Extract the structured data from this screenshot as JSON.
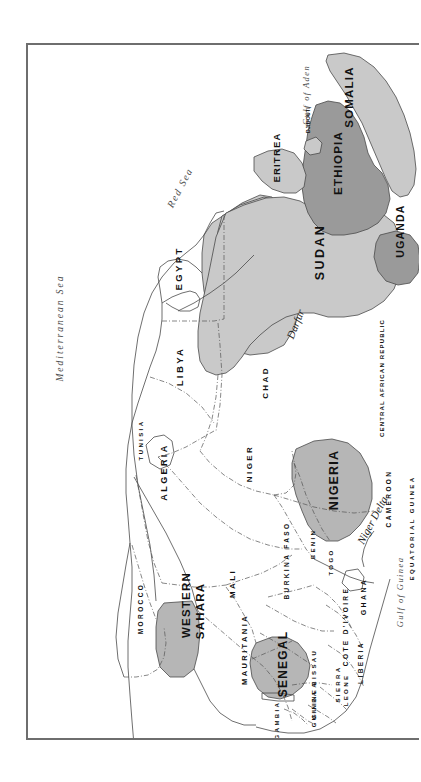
{
  "map": {
    "title": "Northern and Western Africa",
    "orientation": "rotated 90 degrees clockwise (north points right)",
    "frame": {
      "border_color": "#6e6e6e",
      "background": "#ffffff"
    },
    "shading": {
      "unshaded": "#ffffff",
      "light_gray": "#c9c9c9",
      "mid_gray": "#b6b6b6",
      "dark_gray": "#9a9a9a",
      "border_line": "#4a4a4a"
    },
    "countries": [
      {
        "name": "MOROCCO",
        "shade": "unshaded",
        "size": "small"
      },
      {
        "name": "TUNISIA",
        "shade": "unshaded",
        "size": "small"
      },
      {
        "name": "ALGERIA",
        "shade": "unshaded",
        "size": "large"
      },
      {
        "name": "LIBYA",
        "shade": "unshaded",
        "size": "large"
      },
      {
        "name": "EGYPT",
        "shade": "unshaded",
        "size": "large"
      },
      {
        "name": "WESTERN SAHARA",
        "shade": "mid_gray",
        "size": "medium"
      },
      {
        "name": "MAURITANIA",
        "shade": "unshaded",
        "size": "large"
      },
      {
        "name": "MALI",
        "shade": "unshaded",
        "size": "large"
      },
      {
        "name": "NIGER",
        "shade": "unshaded",
        "size": "large"
      },
      {
        "name": "CHAD",
        "shade": "unshaded",
        "size": "large"
      },
      {
        "name": "SUDAN",
        "shade": "light_gray",
        "size": "large"
      },
      {
        "name": "ERITREA",
        "shade": "light_gray",
        "size": "small"
      },
      {
        "name": "DJIBOUTI",
        "shade": "light_gray",
        "size": "tiny"
      },
      {
        "name": "SOMALIA",
        "shade": "light_gray",
        "size": "medium"
      },
      {
        "name": "ETHIOPIA",
        "shade": "dark_gray",
        "size": "large"
      },
      {
        "name": "UGANDA",
        "shade": "dark_gray",
        "size": "small"
      },
      {
        "name": "CENTRAL AFRICAN REPUBLIC",
        "shade": "unshaded",
        "size": "medium"
      },
      {
        "name": "CAMEROON",
        "shade": "unshaded",
        "size": "medium"
      },
      {
        "name": "EQUATORIAL GUINEA",
        "shade": "unshaded",
        "size": "tiny"
      },
      {
        "name": "NIGERIA",
        "shade": "mid_gray",
        "size": "large"
      },
      {
        "name": "BENIN",
        "shade": "unshaded",
        "size": "small"
      },
      {
        "name": "TOGO",
        "shade": "unshaded",
        "size": "tiny"
      },
      {
        "name": "GHANA",
        "shade": "unshaded",
        "size": "small"
      },
      {
        "name": "BURKINA FASO",
        "shade": "unshaded",
        "size": "medium"
      },
      {
        "name": "COTE D'IVOIRE",
        "shade": "unshaded",
        "size": "medium"
      },
      {
        "name": "LIBERIA",
        "shade": "unshaded",
        "size": "small"
      },
      {
        "name": "SIERRA LEONE",
        "shade": "unshaded",
        "size": "small"
      },
      {
        "name": "GUINEA",
        "shade": "unshaded",
        "size": "small"
      },
      {
        "name": "GUINEA BISSAU",
        "shade": "unshaded",
        "size": "tiny"
      },
      {
        "name": "GAMBIA",
        "shade": "unshaded",
        "size": "tiny"
      },
      {
        "name": "SENEGAL",
        "shade": "mid_gray",
        "size": "medium"
      }
    ],
    "water_labels": [
      {
        "name": "Mediterranean Sea"
      },
      {
        "name": "Red Sea"
      },
      {
        "name": "Gulf of Aden"
      },
      {
        "name": "Gulf of Guinea"
      }
    ],
    "region_labels": [
      {
        "name": "Darfur"
      },
      {
        "name": "Niger Delta"
      }
    ]
  }
}
